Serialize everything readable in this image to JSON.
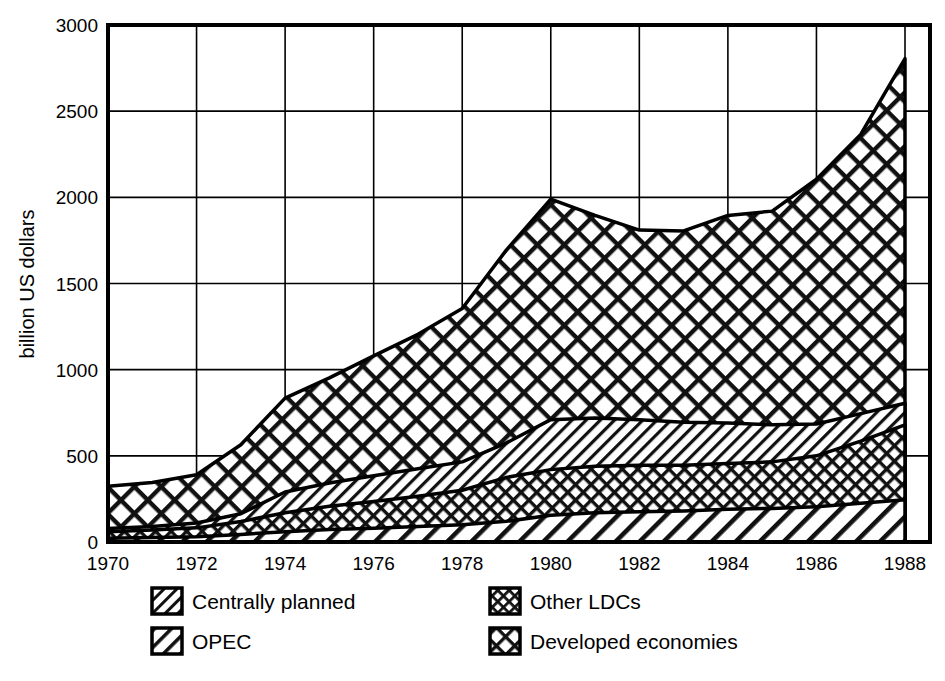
{
  "chart_data": {
    "type": "area",
    "title": "",
    "subtitle": "",
    "xlabel": "",
    "ylabel": "billion US dollars",
    "stacked": true,
    "grid": true,
    "legend_position": "bottom",
    "xlim": [
      1970,
      1989
    ],
    "ylim": [
      0,
      3000
    ],
    "x": [
      1970,
      1971,
      1972,
      1973,
      1974,
      1975,
      1976,
      1977,
      1978,
      1979,
      1980,
      1981,
      1982,
      1983,
      1984,
      1985,
      1986,
      1987,
      1988
    ],
    "x_tick_labels": [
      "1970",
      "1972",
      "1974",
      "1976",
      "1978",
      "1980",
      "1982",
      "1984",
      "1986",
      "1988"
    ],
    "x_ticks": [
      1970,
      1972,
      1974,
      1976,
      1978,
      1980,
      1982,
      1984,
      1986,
      1988
    ],
    "y_ticks": [
      0,
      500,
      1000,
      1500,
      2000,
      2500,
      3000
    ],
    "y_tick_labels": [
      "0",
      "500",
      "1000",
      "1500",
      "2000",
      "2500",
      "3000"
    ],
    "series": [
      {
        "name": "Centrally planned",
        "pattern": "diagonal-coarse",
        "values": [
          22,
          26,
          30,
          44,
          60,
          72,
          80,
          90,
          100,
          120,
          155,
          170,
          175,
          180,
          190,
          195,
          205,
          225,
          245
        ]
      },
      {
        "name": "Other LDCs",
        "pattern": "crosshatch-fine",
        "values": [
          38,
          44,
          52,
          75,
          110,
          135,
          155,
          175,
          200,
          255,
          265,
          270,
          270,
          265,
          265,
          270,
          295,
          360,
          435
        ]
      },
      {
        "name": "OPEC",
        "pattern": "diagonal-fine",
        "values": [
          18,
          20,
          28,
          45,
          120,
          135,
          150,
          160,
          165,
          200,
          290,
          280,
          265,
          250,
          235,
          215,
          185,
          160,
          125
        ]
      },
      {
        "name": "Developed economies",
        "pattern": "crosshatch-coarse",
        "values": [
          245,
          255,
          280,
          400,
          545,
          610,
          695,
          780,
          890,
          1120,
          1280,
          1175,
          1100,
          1110,
          1205,
          1240,
          1420,
          1620,
          2000
        ]
      }
    ],
    "stack_tops": {
      "centrally_planned": [
        22,
        26,
        30,
        44,
        60,
        72,
        80,
        90,
        100,
        120,
        155,
        170,
        175,
        180,
        190,
        195,
        205,
        225,
        245
      ],
      "other_ldcs": [
        60,
        70,
        82,
        119,
        170,
        207,
        235,
        265,
        300,
        375,
        420,
        440,
        445,
        445,
        455,
        465,
        500,
        585,
        680
      ],
      "opec": [
        78,
        90,
        110,
        164,
        290,
        342,
        385,
        425,
        465,
        575,
        710,
        720,
        710,
        695,
        690,
        680,
        685,
        745,
        805
      ],
      "total": [
        323,
        345,
        390,
        564,
        835,
        952,
        1080,
        1205,
        1355,
        1695,
        1990,
        1895,
        1810,
        1805,
        1895,
        1920,
        2105,
        2365,
        2805
      ]
    },
    "legend": [
      {
        "label": "Centrally planned",
        "pattern": "diagonal-fine",
        "column": 0,
        "row": 0
      },
      {
        "label": "OPEC",
        "pattern": "diagonal-coarse",
        "column": 0,
        "row": 1
      },
      {
        "label": "Other LDCs",
        "pattern": "crosshatch-fine",
        "column": 1,
        "row": 0
      },
      {
        "label": "Developed economies",
        "pattern": "crosshatch-coarse",
        "column": 1,
        "row": 1
      }
    ],
    "colors": {
      "foreground": "#000000",
      "background": "#ffffff",
      "grid": "#000000"
    }
  }
}
